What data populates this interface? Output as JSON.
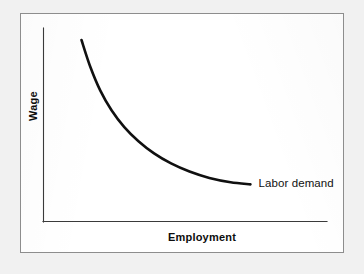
{
  "figure": {
    "background_color": "#f1f1f1",
    "card_color": "#ffffff",
    "frame_color": "#8d8d8d",
    "ink_color": "#101010"
  },
  "chart_data": {
    "type": "line",
    "title": "",
    "xlabel": "Employment",
    "ylabel": "Wage",
    "grid": false,
    "legend_position": "inline-right-end-of-curve",
    "axis_ticks": {
      "x": [],
      "y": []
    },
    "xlim": [
      0,
      1
    ],
    "ylim": [
      0,
      1
    ],
    "annotations": [
      {
        "name": "curve-end-label",
        "text": "Labor demand",
        "anchor_x": 0.74,
        "anchor_y": 0.19
      }
    ],
    "series": [
      {
        "name": "Labor demand",
        "label": "Labor demand",
        "color": "#101010",
        "shape": "convex-decreasing-hyperbola",
        "x": [
          0.134,
          0.165,
          0.2,
          0.24,
          0.285,
          0.335,
          0.39,
          0.45,
          0.515,
          0.585,
          0.66,
          0.73
        ],
        "y": [
          0.938,
          0.8,
          0.678,
          0.575,
          0.488,
          0.415,
          0.352,
          0.3,
          0.258,
          0.225,
          0.203,
          0.192
        ]
      }
    ]
  },
  "labels": {
    "x_axis": "Employment",
    "y_axis": "Wage",
    "curve": "Labor demand"
  }
}
